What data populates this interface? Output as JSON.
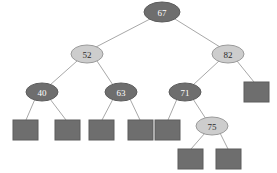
{
  "figure": {
    "name": "red-black-tree",
    "background": "#ffffff",
    "width": 277,
    "height": 173
  },
  "style": {
    "black_node_fill": "#6e6e6e",
    "black_node_stroke": "#5c5c5c",
    "red_node_fill": "#cdcdcd",
    "red_node_stroke": "#9a9a9a",
    "leaf_fill": "#6e6e6e",
    "leaf_stroke": "#5c5c5c",
    "edge_color": "#a8a8a8",
    "black_text": "#ffffff",
    "red_text": "#2b2b2b"
  },
  "chart_data": {
    "type": "diagram",
    "title": "",
    "nodes": [
      {
        "id": "n67",
        "label": "67",
        "color": "black",
        "cx": 162,
        "cy": 12,
        "rx": 18,
        "ry": 10
      },
      {
        "id": "n52",
        "label": "52",
        "color": "red",
        "cx": 87,
        "cy": 54,
        "rx": 16,
        "ry": 9
      },
      {
        "id": "n82",
        "label": "82",
        "color": "red",
        "cx": 228,
        "cy": 54,
        "rx": 16,
        "ry": 9
      },
      {
        "id": "n40",
        "label": "40",
        "color": "black",
        "cx": 42,
        "cy": 92,
        "rx": 16,
        "ry": 9
      },
      {
        "id": "n63",
        "label": "63",
        "color": "black",
        "cx": 121,
        "cy": 92,
        "rx": 16,
        "ry": 9
      },
      {
        "id": "n71",
        "label": "71",
        "color": "black",
        "cx": 185,
        "cy": 92,
        "rx": 16,
        "ry": 9
      },
      {
        "id": "n75",
        "label": "75",
        "color": "red",
        "cx": 212,
        "cy": 126,
        "rx": 16,
        "ry": 9
      }
    ],
    "leaves": [
      {
        "id": "l1",
        "parent": "n40",
        "x": 13,
        "y": 120,
        "w": 25,
        "h": 20
      },
      {
        "id": "l2",
        "parent": "n40",
        "x": 55,
        "y": 120,
        "w": 25,
        "h": 20
      },
      {
        "id": "l3",
        "parent": "n63",
        "x": 89,
        "y": 120,
        "w": 25,
        "h": 20
      },
      {
        "id": "l4",
        "parent": "n63",
        "x": 128,
        "y": 120,
        "w": 25,
        "h": 20
      },
      {
        "id": "l5",
        "parent": "n71",
        "x": 155,
        "y": 120,
        "w": 25,
        "h": 20
      },
      {
        "id": "l6",
        "parent": "n82",
        "x": 244,
        "y": 82,
        "w": 25,
        "h": 20
      },
      {
        "id": "l7",
        "parent": "n75",
        "x": 178,
        "y": 149,
        "w": 25,
        "h": 20
      },
      {
        "id": "l8",
        "parent": "n75",
        "x": 216,
        "y": 149,
        "w": 25,
        "h": 20
      }
    ],
    "edges": [
      {
        "from": "n67",
        "to": "n52",
        "x1": 150,
        "y1": 19,
        "x2": 96,
        "y2": 47
      },
      {
        "from": "n67",
        "to": "n82",
        "x1": 175,
        "y1": 19,
        "x2": 220,
        "y2": 47
      },
      {
        "from": "n52",
        "to": "n40",
        "x1": 77,
        "y1": 61,
        "x2": 50,
        "y2": 85
      },
      {
        "from": "n52",
        "to": "n63",
        "x1": 97,
        "y1": 61,
        "x2": 113,
        "y2": 85
      },
      {
        "from": "n82",
        "to": "n71",
        "x1": 219,
        "y1": 61,
        "x2": 193,
        "y2": 85
      },
      {
        "from": "n82",
        "to": "l6",
        "x1": 237,
        "y1": 61,
        "x2": 254,
        "y2": 82
      },
      {
        "from": "n40",
        "to": "l1",
        "x1": 35,
        "y1": 99,
        "x2": 26,
        "y2": 120
      },
      {
        "from": "n40",
        "to": "l2",
        "x1": 50,
        "y1": 99,
        "x2": 66,
        "y2": 120
      },
      {
        "from": "n63",
        "to": "l3",
        "x1": 113,
        "y1": 99,
        "x2": 102,
        "y2": 120
      },
      {
        "from": "n63",
        "to": "l4",
        "x1": 130,
        "y1": 99,
        "x2": 140,
        "y2": 120
      },
      {
        "from": "n71",
        "to": "l5",
        "x1": 177,
        "y1": 99,
        "x2": 168,
        "y2": 120
      },
      {
        "from": "n71",
        "to": "n75",
        "x1": 193,
        "y1": 99,
        "x2": 206,
        "y2": 119
      },
      {
        "from": "n75",
        "to": "l7",
        "x1": 205,
        "y1": 133,
        "x2": 191,
        "y2": 149
      },
      {
        "from": "n75",
        "to": "l8",
        "x1": 220,
        "y1": 133,
        "x2": 228,
        "y2": 149
      }
    ],
    "node_labels": [
      "67",
      "52",
      "82",
      "40",
      "63",
      "71",
      "75"
    ],
    "black_nodes": [
      "67",
      "40",
      "63",
      "71"
    ],
    "red_nodes": [
      "52",
      "82",
      "75"
    ],
    "leaf_count": 8,
    "legend": []
  }
}
